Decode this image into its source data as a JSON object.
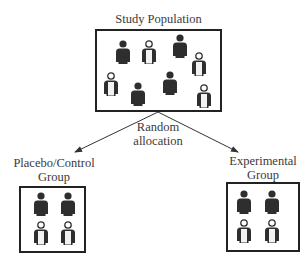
{
  "title": "Study Population",
  "split_label": [
    "Random",
    "allocation"
  ],
  "groups": [
    {
      "name_line1": "Placebo/Control",
      "name_line2": "Group"
    },
    {
      "name_line1": "Experimental",
      "name_line2": "Group"
    }
  ],
  "colors": {
    "dark_person": "#2e2e2e",
    "outline": "#222222",
    "text": "#3a3a3a"
  }
}
